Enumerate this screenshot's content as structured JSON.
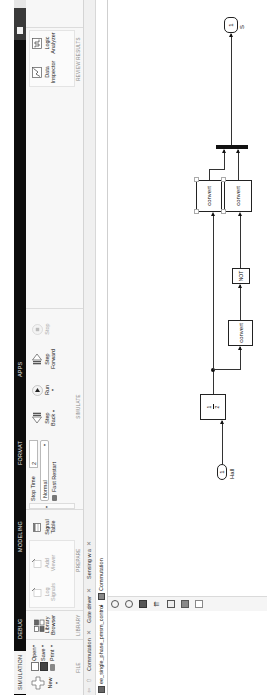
{
  "toolstrip": {
    "tabs": [
      {
        "label": "SIMULATION",
        "active": true
      },
      {
        "label": "DEBUG"
      },
      {
        "label": "MODELING"
      },
      {
        "label": "FORMAT"
      },
      {
        "label": "APPS"
      }
    ]
  },
  "ribbon": {
    "file": {
      "title": "FILE",
      "new_label": "New",
      "open_label": "Open",
      "save_label": "Save",
      "print_label": "Print"
    },
    "library": {
      "title": "LIBRARY",
      "library_browser_label_1": "Library",
      "library_browser_label_2": "Browser"
    },
    "prepare": {
      "title": "PREPARE",
      "log_signals_1": "Log",
      "log_signals_2": "Signals",
      "add_viewer_1": "Add",
      "add_viewer_2": "Viewer",
      "signal_table_1": "Signal",
      "signal_table_2": "Table"
    },
    "simulate": {
      "title": "SIMULATE",
      "stop_time_label": "Stop Time",
      "stop_time_value": "2",
      "mode_value": "Normal",
      "fast_restart_label": "Fast Restart",
      "step_back_1": "Step",
      "step_back_2": "Back",
      "run_label": "Run",
      "step_forward_1": "Step",
      "step_forward_2": "Forward",
      "stop_label": "Stop"
    },
    "review": {
      "title": "REVIEW RESULTS",
      "data_inspector_1": "Data",
      "data_inspector_2": "Inspector",
      "logic_analyzer_1": "Logic",
      "logic_analyzer_2": "Analyzer"
    }
  },
  "doc_tabs": [
    {
      "label": "Commutation"
    },
    {
      "label": "Gate driver"
    },
    {
      "label": "Sensing w a"
    }
  ],
  "breadcrumb": {
    "root": "ee_single_phase_pmsm_control",
    "separator": "▸",
    "current": "Commutation"
  },
  "diagram": {
    "inport": {
      "number": "1",
      "name": "Hall"
    },
    "gain": {
      "numerator": "1",
      "denominator": "2"
    },
    "convert1": "convert",
    "not_block": "NOT",
    "convert2": "convert",
    "convert3": "convert",
    "outport": {
      "number": "1",
      "name": "S"
    }
  }
}
